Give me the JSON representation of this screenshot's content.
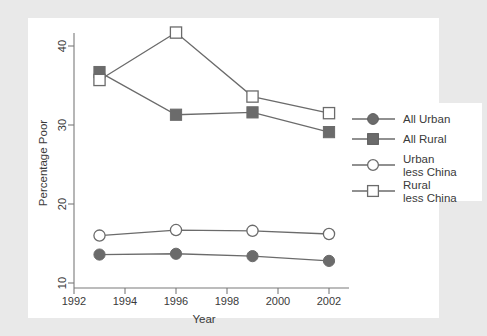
{
  "chart_data": {
    "type": "line",
    "title": "",
    "xlabel": "Year",
    "ylabel": "Percentage Poor",
    "x": [
      1993,
      1996,
      1999,
      2002
    ],
    "xlim": [
      1992,
      2003
    ],
    "ylim": [
      9.2,
      43.5
    ],
    "xticks": [
      1992,
      1994,
      1996,
      1998,
      2000,
      2002
    ],
    "yticks": [
      10,
      20,
      30,
      40
    ],
    "grid": false,
    "legend_position": "right",
    "series": [
      {
        "name": "All Urban",
        "marker": "filled-circle",
        "values": [
          13.6,
          13.7,
          13.4,
          12.8
        ]
      },
      {
        "name": "All Rural",
        "marker": "filled-square",
        "values": [
          36.7,
          31.3,
          31.6,
          29.1
        ]
      },
      {
        "name": "Urban less China",
        "marker": "open-circle",
        "values": [
          16.0,
          16.7,
          16.6,
          16.2
        ]
      },
      {
        "name": "Rural less China",
        "marker": "open-square",
        "values": [
          35.7,
          41.7,
          33.6,
          31.5
        ]
      }
    ]
  },
  "axes": {
    "x": {
      "label": "Year",
      "tick_labels": [
        "1992",
        "1994",
        "1996",
        "1998",
        "2000",
        "2002"
      ]
    },
    "y": {
      "label": "Percentage Poor",
      "tick_labels": [
        "10",
        "20",
        "30",
        "40"
      ]
    }
  },
  "legend": {
    "entries": [
      {
        "label_line1": "All Urban",
        "label_line2": "",
        "marker": "filled-circle"
      },
      {
        "label_line1": "All Rural",
        "label_line2": "",
        "marker": "filled-square"
      },
      {
        "label_line1": "Urban",
        "label_line2": "less China",
        "marker": "open-circle"
      },
      {
        "label_line1": "Rural",
        "label_line2": "less China",
        "marker": "open-square"
      }
    ]
  },
  "colors": {
    "background": "#e9e9e9",
    "plot_background": "#ffffff",
    "marker": "#6b6b6b",
    "marker_open_edge": "#6b6b6b",
    "line": "#6b6b6b",
    "axis": "#7a7a7a",
    "text": "#3a3a3a",
    "legend_background": "#ffffff"
  }
}
